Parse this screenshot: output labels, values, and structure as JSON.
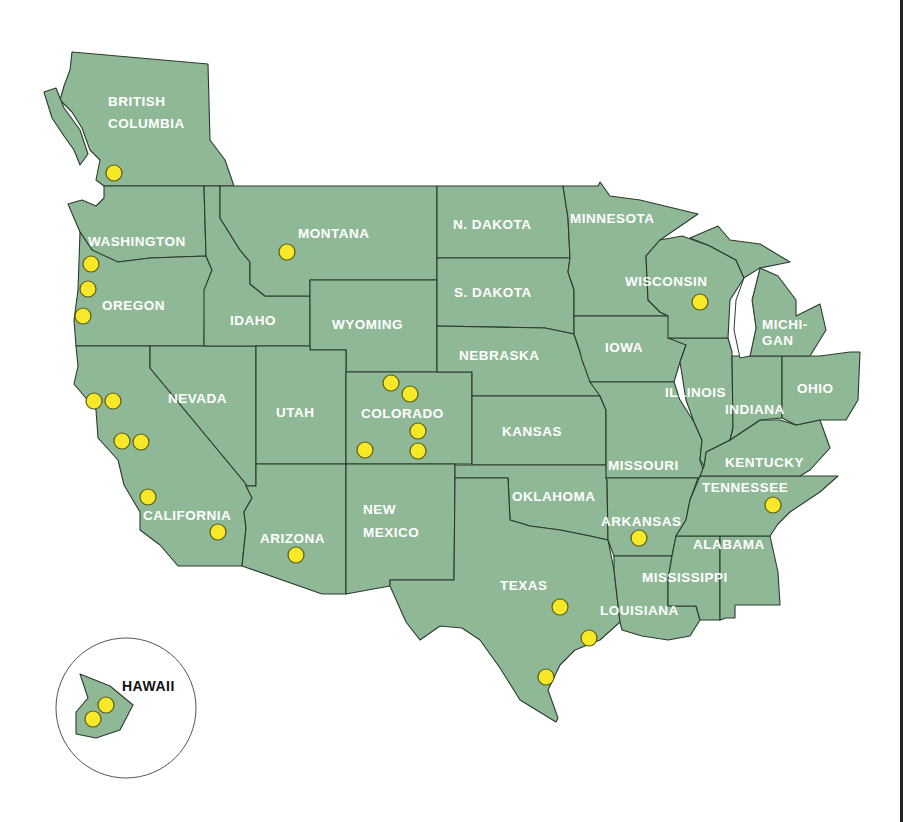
{
  "map": {
    "title": "",
    "colors": {
      "land": "#8fb896",
      "border": "#2c3a2e",
      "marker": "#f7e829",
      "label": "#ffffff",
      "background": "#ffffff"
    },
    "labels": {
      "british_columbia_1": "BRITISH",
      "british_columbia_2": "COLUMBIA",
      "washington": "WASHINGTON",
      "oregon": "OREGON",
      "california": "CALIFORNIA",
      "nevada": "NEVADA",
      "idaho": "IDAHO",
      "montana": "MONTANA",
      "wyoming": "WYOMING",
      "utah": "UTAH",
      "colorado": "COLORADO",
      "arizona": "ARIZONA",
      "new_mexico_1": "NEW",
      "new_mexico_2": "MEXICO",
      "n_dakota": "N. DAKOTA",
      "s_dakota": "S. DAKOTA",
      "nebraska": "NEBRASKA",
      "kansas": "KANSAS",
      "oklahoma": "OKLAHOMA",
      "texas": "TEXAS",
      "minnesota": "MINNESOTA",
      "iowa": "IOWA",
      "missouri": "MISSOURI",
      "arkansas": "ARKANSAS",
      "louisiana": "LOUISIANA",
      "wisconsin": "WISCONSIN",
      "illinois": "ILLINOIS",
      "michigan_1": "MICHI-",
      "michigan_2": "GAN",
      "indiana": "INDIANA",
      "ohio": "OHIO",
      "kentucky": "KENTUCKY",
      "tennessee": "TENNESSEE",
      "mississippi": "MISSISSIPPI",
      "alabama": "ALABAMA",
      "hawaii": "HAWAII"
    },
    "markers": [
      {
        "region": "British Columbia",
        "x": 114,
        "y": 173
      },
      {
        "region": "Oregon",
        "x": 91,
        "y": 264
      },
      {
        "region": "Oregon",
        "x": 88,
        "y": 289
      },
      {
        "region": "Oregon",
        "x": 83,
        "y": 316
      },
      {
        "region": "Montana",
        "x": 287,
        "y": 252
      },
      {
        "region": "California",
        "x": 94,
        "y": 401
      },
      {
        "region": "California",
        "x": 113,
        "y": 401
      },
      {
        "region": "California",
        "x": 122,
        "y": 441
      },
      {
        "region": "California",
        "x": 141,
        "y": 442
      },
      {
        "region": "California",
        "x": 148,
        "y": 497
      },
      {
        "region": "California",
        "x": 218,
        "y": 532
      },
      {
        "region": "Arizona",
        "x": 296,
        "y": 555
      },
      {
        "region": "Colorado",
        "x": 391,
        "y": 383
      },
      {
        "region": "Colorado",
        "x": 410,
        "y": 394
      },
      {
        "region": "Colorado",
        "x": 418,
        "y": 431
      },
      {
        "region": "Colorado",
        "x": 418,
        "y": 451
      },
      {
        "region": "Colorado",
        "x": 365,
        "y": 450
      },
      {
        "region": "Wisconsin",
        "x": 700,
        "y": 302
      },
      {
        "region": "Arkansas",
        "x": 639,
        "y": 538
      },
      {
        "region": "Tennessee",
        "x": 773,
        "y": 505
      },
      {
        "region": "Texas",
        "x": 560,
        "y": 607
      },
      {
        "region": "Texas",
        "x": 589,
        "y": 638
      },
      {
        "region": "Texas",
        "x": 546,
        "y": 677
      },
      {
        "region": "Hawaii",
        "x": 106,
        "y": 705
      },
      {
        "region": "Hawaii",
        "x": 93,
        "y": 719
      }
    ]
  }
}
